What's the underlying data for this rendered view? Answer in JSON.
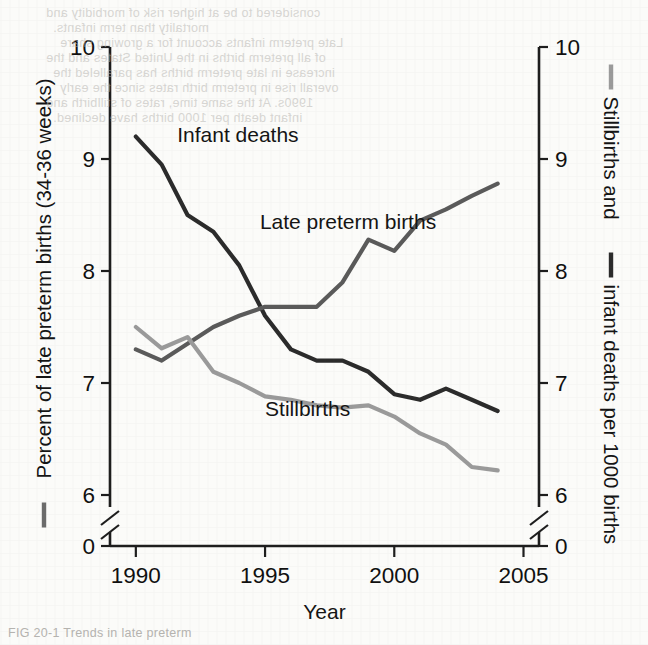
{
  "figure": {
    "background_color": "#fbfbf9",
    "caption_fragment": "FIG 20-1  Trends in late preterm",
    "bleed_through_lines": [
      "considered to be at higher risk of morbidity and",
      "mortality than term infants.",
      "Late preterm infants account for a growing share",
      "of all preterm births in the United States and the",
      "increase in late preterm births has paralleled the",
      "overall rise in preterm birth rates since the early",
      "1990s. At the same time, rates of stillbirth and",
      "infant death per 1000 births have declined."
    ]
  },
  "chart_data": {
    "type": "line",
    "title": "",
    "xlabel": "Year",
    "ylabel_left": "Percent of late preterm births (34-36 weeks)",
    "ylabel_right": "Stillbirths and    infant deaths per 1000 births",
    "ylabel_right_part1": "Stillbirths and",
    "ylabel_right_part2": "infant deaths per 1000 births",
    "x": [
      1990,
      1991,
      1992,
      1993,
      1994,
      1995,
      1996,
      1997,
      1998,
      1999,
      2000,
      2001,
      2002,
      2003,
      2004
    ],
    "xlim": [
      1989,
      2005.6
    ],
    "xticks": [
      1990,
      1995,
      2000,
      2005
    ],
    "xticklabels": [
      "1990",
      "1995",
      "2000",
      "2005"
    ],
    "ylim": [
      5.72,
      10
    ],
    "yticks": [
      10,
      9,
      8,
      7,
      6,
      0
    ],
    "yticklabels_left": [
      "10",
      "9",
      "8",
      "7",
      "6",
      "0"
    ],
    "yticklabels_right": [
      "10",
      "9",
      "8",
      "7",
      "6",
      "0"
    ],
    "axis_break": true,
    "axis_break_note": "y-axis broken between 6 and 0 on both left and right axes",
    "grid": false,
    "legend_position": "inline-annotations",
    "series": [
      {
        "name": "Infant deaths",
        "color": "#2b2b2b",
        "axis": "right",
        "label_x": 1991.6,
        "label_y": 9.22,
        "values": [
          9.2,
          8.95,
          8.5,
          8.35,
          8.05,
          7.6,
          7.3,
          7.2,
          7.2,
          7.1,
          6.9,
          6.85,
          6.95,
          6.85,
          6.75
        ]
      },
      {
        "name": "Late preterm births",
        "color": "#5a5a5a",
        "axis": "left",
        "label_x": 1994.8,
        "label_y": 8.45,
        "values": [
          7.3,
          7.2,
          7.35,
          7.5,
          7.6,
          7.68,
          7.68,
          7.68,
          7.9,
          8.28,
          8.18,
          8.45,
          8.55,
          8.67,
          8.78
        ]
      },
      {
        "name": "Stillbirths",
        "color": "#9a9a9a",
        "axis": "right",
        "label_x": 1995.0,
        "label_y": 6.78,
        "values": [
          7.5,
          7.31,
          7.41,
          7.1,
          7.0,
          6.88,
          6.85,
          6.8,
          6.78,
          6.8,
          6.7,
          6.55,
          6.45,
          6.25,
          6.22
        ]
      }
    ],
    "annotations": [
      {
        "text": "Infant deaths",
        "color": "#1a1a1a"
      },
      {
        "text": "Late preterm births",
        "color": "#1a1a1a"
      },
      {
        "text": "Stillbirths",
        "color": "#1a1a1a"
      }
    ],
    "axis_color": "#1d1d1d",
    "tick_label_color": "#101010",
    "legend_dash_left_color": "#6b6b6b",
    "legend_dash_right_stillbirths_color": "#9a9a9a",
    "legend_dash_right_infant_color": "#2b2b2b"
  }
}
